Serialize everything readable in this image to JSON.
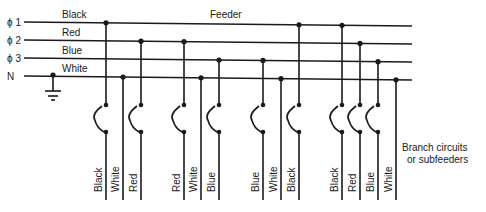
{
  "feeder": {
    "title": "Feeder",
    "x_start": 24,
    "x_end": 412,
    "lines": [
      {
        "id": "phi1",
        "label": "ϕ 1",
        "wire_color": "Black",
        "y": 22,
        "y_end": 26,
        "label_x": 62
      },
      {
        "id": "phi2",
        "label": "ϕ 2",
        "wire_color": "Red",
        "y": 40,
        "y_end": 44,
        "label_x": 62
      },
      {
        "id": "phi3",
        "label": "ϕ 3",
        "wire_color": "Blue",
        "y": 58,
        "y_end": 62,
        "label_x": 62
      },
      {
        "id": "N",
        "label": "N",
        "wire_color": "White",
        "y": 76,
        "y_end": 80,
        "label_x": 62
      }
    ]
  },
  "ground": {
    "x": 53,
    "y": 75
  },
  "branches": [
    {
      "x": 106,
      "line": 0,
      "label": "Black",
      "switch": true
    },
    {
      "x": 123,
      "line": 3,
      "label": "White",
      "switch": false
    },
    {
      "x": 141,
      "line": 1,
      "label": "Red",
      "switch": true
    },
    {
      "x": 184,
      "line": 1,
      "label": "Red",
      "switch": true
    },
    {
      "x": 201,
      "line": 3,
      "label": "White",
      "switch": false
    },
    {
      "x": 219,
      "line": 2,
      "label": "Blue",
      "switch": true
    },
    {
      "x": 263,
      "line": 2,
      "label": "Blue",
      "switch": true
    },
    {
      "x": 281,
      "line": 3,
      "label": "White",
      "switch": false
    },
    {
      "x": 299,
      "line": 0,
      "label": "Black",
      "switch": true
    },
    {
      "x": 342,
      "line": 0,
      "label": "Black",
      "switch": true
    },
    {
      "x": 360,
      "line": 1,
      "label": "Red",
      "switch": true
    },
    {
      "x": 378,
      "line": 2,
      "label": "Blue",
      "switch": true
    },
    {
      "x": 396,
      "line": 3,
      "label": "White",
      "switch": false
    }
  ],
  "switch_geometry": {
    "top_y": 105,
    "bottom_y": 132,
    "bulge": 12
  },
  "branch_end_y": 200,
  "branch_note": {
    "line1": "Branch circuits",
    "line2": "or subfeeders"
  }
}
